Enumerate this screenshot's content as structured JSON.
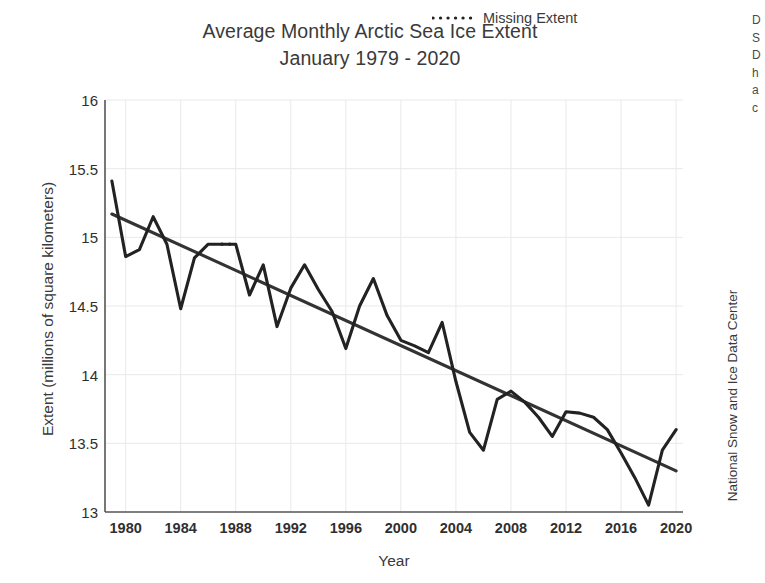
{
  "title": {
    "line1": "Average Monthly Arctic Sea Ice Extent",
    "line2": "January 1979 - 2020"
  },
  "axes": {
    "xlabel": "Year",
    "ylabel": "Extent (millions of square kilometers)",
    "xticks": [
      "1980",
      "1984",
      "1988",
      "1992",
      "1996",
      "2000",
      "2004",
      "2008",
      "2012",
      "2016",
      "2020"
    ],
    "yticks": [
      "16",
      "15.5",
      "15",
      "14.5",
      "14",
      "13.5",
      "13"
    ]
  },
  "legend": {
    "label": "Missing Extent",
    "style": "dotted"
  },
  "credit": "National Snow and Ice Data Center",
  "edge_text": {
    "l1": "D",
    "l2": "S",
    "l3": "D",
    "l4": "h",
    "l5": "a",
    "l6": "c"
  },
  "colors": {
    "line": "#222222",
    "trend": "#333333",
    "grid": "#e9e9e9",
    "axis": "#555555",
    "text": "#3a3a3a",
    "background": "#ffffff"
  },
  "chart_data": {
    "type": "line",
    "title": "Average Monthly Arctic Sea Ice Extent January 1979 - 2020",
    "xlabel": "Year",
    "ylabel": "Extent (millions of square kilometers)",
    "xlim": [
      1978.5,
      2020.5
    ],
    "ylim": [
      13,
      16
    ],
    "xticks": [
      1980,
      1984,
      1988,
      1992,
      1996,
      2000,
      2004,
      2008,
      2012,
      2016,
      2020
    ],
    "yticks": [
      13,
      13.5,
      14,
      14.5,
      15,
      15.5,
      16
    ],
    "grid": true,
    "legend_position": "top-right",
    "x": [
      1979,
      1980,
      1981,
      1982,
      1983,
      1984,
      1985,
      1986,
      1987,
      1988,
      1989,
      1990,
      1991,
      1992,
      1993,
      1994,
      1995,
      1996,
      1997,
      1998,
      1999,
      2000,
      2001,
      2002,
      2003,
      2004,
      2005,
      2006,
      2007,
      2008,
      2009,
      2010,
      2011,
      2012,
      2013,
      2014,
      2015,
      2016,
      2017,
      2018,
      2019,
      2020
    ],
    "series": [
      {
        "name": "January Arctic Sea Ice Extent",
        "style": "solid",
        "values": [
          15.41,
          14.86,
          14.91,
          15.15,
          14.95,
          14.48,
          14.85,
          14.95,
          14.95,
          14.95,
          14.58,
          14.8,
          14.35,
          14.63,
          14.8,
          14.62,
          14.46,
          14.19,
          14.5,
          14.7,
          14.43,
          14.25,
          14.21,
          14.16,
          14.38,
          13.95,
          13.58,
          13.45,
          13.82,
          13.88,
          13.8,
          13.69,
          13.55,
          13.73,
          13.72,
          13.69,
          13.6,
          13.43,
          13.25,
          13.05,
          13.45,
          13.6
        ]
      },
      {
        "name": "Missing Extent",
        "style": "dotted",
        "x": [
          1987,
          1988
        ],
        "values": [
          14.95,
          14.95
        ]
      },
      {
        "name": "Linear trend",
        "style": "solid-trend",
        "x": [
          1979,
          2020
        ],
        "values": [
          15.17,
          13.3
        ]
      }
    ]
  }
}
